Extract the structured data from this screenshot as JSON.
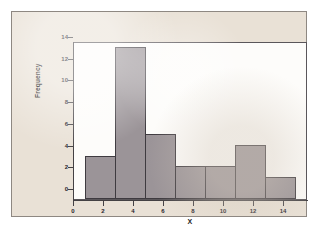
{
  "figure": {
    "panel_background": "#e9e1d6",
    "panel_border": "#8e8882",
    "plot_background": "#fdfcfa",
    "plot_border": "#5a565a"
  },
  "chart_data": {
    "type": "bar",
    "title": "",
    "subtitle": "",
    "xlabel": "X",
    "ylabel": "Frequency",
    "bin_width": 2,
    "bin_edges": [
      0,
      2,
      4,
      6,
      8,
      10,
      12,
      14
    ],
    "categories": [
      "0-2",
      "2-4",
      "4-6",
      "6-8",
      "8-10",
      "10-12",
      "12-14"
    ],
    "values": [
      4,
      14,
      6,
      3,
      3,
      5,
      2
    ],
    "bar_color": "#9b9498",
    "bar_edge_color": "#3f3b40",
    "xlim": [
      0,
      15
    ],
    "ylim": [
      0,
      15
    ],
    "xticks": [
      0,
      2,
      4,
      6,
      8,
      10,
      12,
      14
    ],
    "xtick_labels": [
      "0",
      "2",
      "4",
      "6",
      "8",
      "10",
      "12",
      "14"
    ],
    "yticks": [
      0,
      2,
      4,
      6,
      8,
      10,
      12,
      14
    ],
    "ytick_labels": [
      "0",
      "2",
      "4",
      "6",
      "8",
      "10",
      "12",
      "14"
    ],
    "grid": false,
    "legend": null,
    "annotations": []
  }
}
